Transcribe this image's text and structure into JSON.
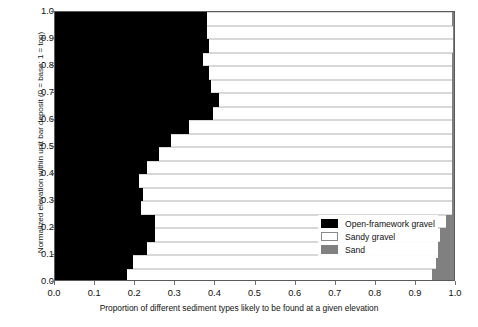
{
  "chart_data": {
    "type": "bar",
    "orientation": "horizontal",
    "stacked": true,
    "title": "",
    "xlabel": "Proportion of different sediment types likely to be found at a given elevation",
    "ylabel": "Normalized elevation within unit bar deposit (0 = base; 1 = top)",
    "xlim": [
      0.0,
      1.0
    ],
    "ylim": [
      0.0,
      1.0
    ],
    "grid": false,
    "legend_position": "center-right-inside",
    "xticks": [
      "0.0",
      "0.1",
      "0.2",
      "0.3",
      "0.4",
      "0.5",
      "0.6",
      "0.7",
      "0.8",
      "0.9",
      "1.0"
    ],
    "xtick_values": [
      0.0,
      0.1,
      0.2,
      0.3,
      0.4,
      0.5,
      0.6,
      0.7,
      0.8,
      0.9,
      1.0
    ],
    "yticks": [
      "0.0",
      "0.1",
      "0.2",
      "0.3",
      "0.4",
      "0.5",
      "0.6",
      "0.7",
      "0.8",
      "0.9",
      "1.0"
    ],
    "ytick_values": [
      0.0,
      0.1,
      0.2,
      0.3,
      0.4,
      0.5,
      0.6,
      0.7,
      0.8,
      0.9,
      1.0
    ],
    "bin_centers": [
      0.975,
      0.925,
      0.875,
      0.825,
      0.775,
      0.725,
      0.675,
      0.625,
      0.575,
      0.525,
      0.475,
      0.425,
      0.375,
      0.325,
      0.275,
      0.225,
      0.175,
      0.125,
      0.075,
      0.025
    ],
    "series": [
      {
        "name": "Open-framework gravel",
        "color": "#000000",
        "values": [
          0.18,
          0.195,
          0.23,
          0.25,
          0.25,
          0.215,
          0.22,
          0.21,
          0.23,
          0.26,
          0.29,
          0.335,
          0.395,
          0.41,
          0.39,
          0.385,
          0.37,
          0.385,
          0.38,
          0.38
        ]
      },
      {
        "name": "Sandy gravel",
        "color": "#ffffff",
        "values": [
          0.765,
          0.76,
          0.73,
          0.715,
          0.73,
          0.78,
          0.775,
          0.785,
          0.765,
          0.735,
          0.705,
          0.66,
          0.6,
          0.585,
          0.605,
          0.61,
          0.625,
          0.612,
          0.617,
          0.615
        ]
      },
      {
        "name": "Sand",
        "color": "#808080",
        "values": [
          0.055,
          0.045,
          0.04,
          0.035,
          0.02,
          0.005,
          0.005,
          0.005,
          0.005,
          0.005,
          0.005,
          0.005,
          0.005,
          0.005,
          0.005,
          0.005,
          0.005,
          0.003,
          0.003,
          0.005
        ]
      }
    ]
  },
  "legend": {
    "items": [
      {
        "label": "Open-framework gravel",
        "swatch": "black"
      },
      {
        "label": "Sandy gravel",
        "swatch": "white"
      },
      {
        "label": "Sand",
        "swatch": "gray"
      }
    ]
  }
}
